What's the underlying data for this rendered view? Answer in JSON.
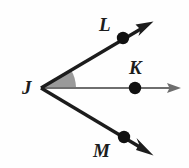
{
  "figure": {
    "background_color": "#fefefe",
    "width": 189,
    "height": 168,
    "vertex": {
      "name": "J",
      "label": "J",
      "x": 41,
      "y": 88
    },
    "points": [
      {
        "name": "L",
        "label": "L",
        "dot_x": 123,
        "dot_y": 38,
        "dot_radius": 6,
        "label_x": 99,
        "label_y": 15
      },
      {
        "name": "K",
        "label": "K",
        "dot_x": 135,
        "dot_y": 88,
        "dot_radius": 6,
        "label_x": 129,
        "label_y": 58
      },
      {
        "name": "M",
        "label": "M",
        "dot_x": 124,
        "dot_y": 137,
        "dot_radius": 6,
        "label_x": 93,
        "label_y": 141
      }
    ],
    "rays": [
      {
        "name": "ray-JL",
        "from": "J",
        "through": "L",
        "tip_x": 152,
        "tip_y": 22,
        "color": "#1c1c1c",
        "stroke_width": 3.2,
        "arrowhead": "solid"
      },
      {
        "name": "ray-JK",
        "from": "J",
        "through": "K",
        "tip_x": 180,
        "tip_y": 88,
        "color": "#6e6e6e",
        "stroke_width": 2,
        "arrowhead": "solid"
      },
      {
        "name": "ray-JM",
        "from": "J",
        "through": "M",
        "tip_x": 152,
        "tip_y": 155,
        "color": "#1c1c1c",
        "stroke_width": 3.2,
        "arrowhead": "solid"
      }
    ],
    "shaded_angle": {
      "name": "angle-LJK",
      "between_rays": [
        "ray-JL",
        "ray-JK"
      ],
      "fill_color": "#9a9a9a",
      "arc_radius": 36
    },
    "colors": {
      "ink": "#1c1c1c",
      "gray_ray": "#6e6e6e",
      "shade": "#9a9a9a",
      "background": "#fefefe"
    }
  }
}
